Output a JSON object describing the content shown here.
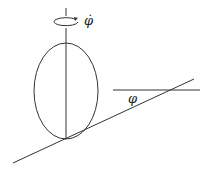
{
  "diagram": {
    "labels": {
      "angular_velocity": "φ̇",
      "incline_angle": "φ"
    },
    "colors": {
      "stroke": "#333333",
      "background": "#ffffff"
    }
  }
}
